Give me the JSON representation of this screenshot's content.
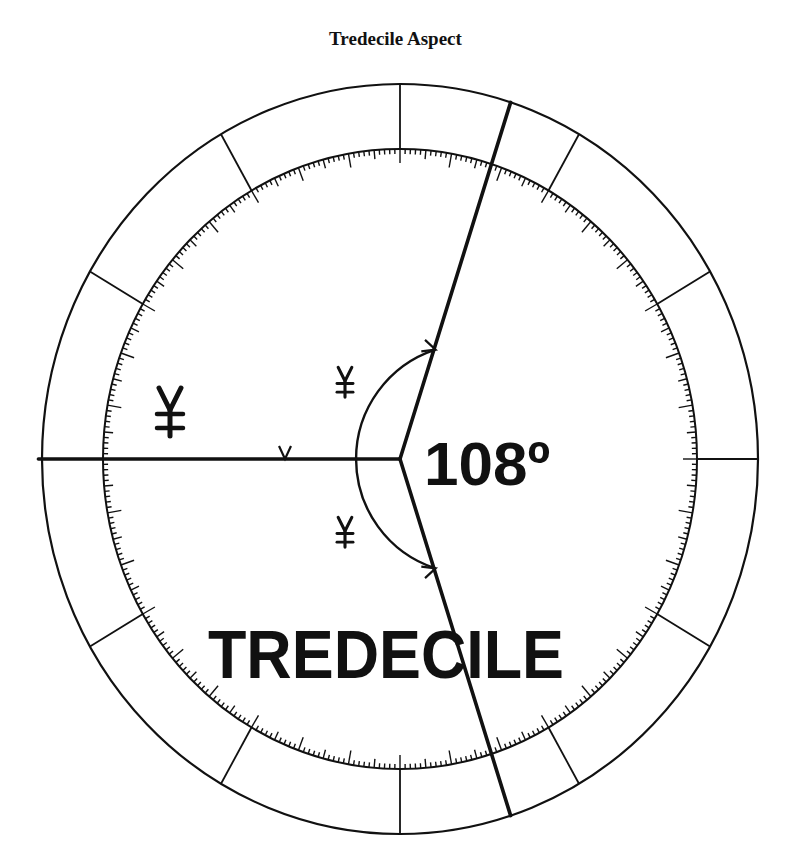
{
  "title": "Tredecile Aspect",
  "labels": {
    "angle": "108º",
    "aspect_name": "TREDECILE"
  },
  "glyphs": [
    {
      "symbol": "tredecile-glyph",
      "role": "outer",
      "x": 170,
      "y": 410,
      "size": 1.0
    },
    {
      "symbol": "tredecile-glyph",
      "role": "upper-arc",
      "x": 345,
      "y": 381,
      "size": 0.62
    },
    {
      "symbol": "tredecile-glyph",
      "role": "lower-arc",
      "x": 345,
      "y": 531,
      "size": 0.62
    }
  ],
  "wheel": {
    "center": [
      400,
      459
    ],
    "outer_radius": [
      358,
      375
    ],
    "inner_radius": [
      297,
      310
    ],
    "sector_divisions": 12,
    "tick_step_deg": 1,
    "ticks": {
      "minor": 5,
      "mid": 9,
      "major": 14
    }
  },
  "aspect": {
    "angle_deg": 108,
    "reference_line_deg": 180,
    "line_angles_deg": [
      180,
      72,
      288
    ],
    "arc_radius": 115
  },
  "colors": {
    "ink": "#111111",
    "background": "#ffffff"
  }
}
